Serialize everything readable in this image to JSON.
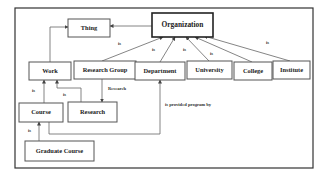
{
  "diagram": {
    "type": "ontology class hierarchy",
    "nodes": [
      {
        "id": "thing",
        "label": "Thing"
      },
      {
        "id": "organization",
        "label": "Organization",
        "emphasis": true
      },
      {
        "id": "work",
        "label": "Work"
      },
      {
        "id": "research_group",
        "label": "Research Group"
      },
      {
        "id": "department",
        "label": "Department"
      },
      {
        "id": "university",
        "label": "University"
      },
      {
        "id": "college",
        "label": "College"
      },
      {
        "id": "institute",
        "label": "Institute"
      },
      {
        "id": "course",
        "label": "Course"
      },
      {
        "id": "research",
        "label": "Research"
      },
      {
        "id": "graduate_course",
        "label": "Graduate Course"
      }
    ],
    "edges": [
      {
        "from": "organization",
        "to": "thing",
        "label": ""
      },
      {
        "from": "work",
        "to": "thing",
        "label": ""
      },
      {
        "from": "research_group",
        "to": "organization",
        "label": "is"
      },
      {
        "from": "department",
        "to": "organization",
        "label": "is"
      },
      {
        "from": "university",
        "to": "organization",
        "label": "is"
      },
      {
        "from": "college",
        "to": "organization",
        "label": "is"
      },
      {
        "from": "institute",
        "to": "organization",
        "label": "is"
      },
      {
        "from": "course",
        "to": "work",
        "label": "is"
      },
      {
        "from": "research",
        "to": "work",
        "label": "is"
      },
      {
        "from": "research_group",
        "to": "research",
        "label": "Research"
      },
      {
        "from": "course",
        "to": "department",
        "label": "is provided program by"
      },
      {
        "from": "graduate_course",
        "to": "course",
        "label": "is"
      }
    ]
  }
}
